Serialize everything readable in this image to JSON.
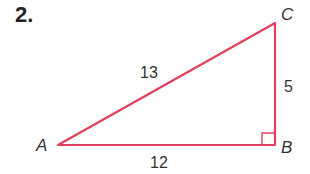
{
  "problem": {
    "number": "2."
  },
  "triangle": {
    "stroke_color": "#e0405e",
    "vertices": {
      "A": "A",
      "B": "B",
      "C": "C"
    },
    "sides": {
      "AC": "13",
      "BC": "5",
      "AB": "12"
    },
    "right_angle_at": "B"
  }
}
